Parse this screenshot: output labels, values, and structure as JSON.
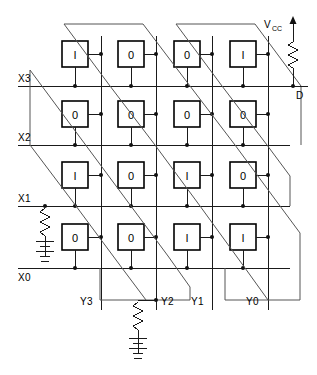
{
  "diagram": {
    "type": "schematic",
    "colors": {
      "background": "#ffffff",
      "wire": "#1a1a1a",
      "diagonal_wire": "#555555",
      "cell_border": "#000000",
      "text": "#000000"
    },
    "row_labels": [
      "X3",
      "X2",
      "X1",
      "X0"
    ],
    "column_labels": [
      "Y3",
      "Y2",
      "Y1",
      "Y0"
    ],
    "supply_label": "V",
    "supply_subscript": "CC",
    "output_label": "D",
    "cells": [
      {
        "row": "X3",
        "values": [
          "I",
          "0",
          "0",
          "I"
        ]
      },
      {
        "row": "X2",
        "values": [
          "0",
          "0",
          "0",
          "0"
        ]
      },
      {
        "row": "X1",
        "values": [
          "I",
          "0",
          "I",
          "0"
        ]
      },
      {
        "row": "X0",
        "values": [
          "0",
          "0",
          "I",
          "I"
        ]
      }
    ],
    "components": {
      "pullup_resistor": "resistor",
      "x1_resistor": "resistor",
      "x1_battery": "battery",
      "y2_resistor": "resistor",
      "y2_ground": "ground"
    }
  }
}
